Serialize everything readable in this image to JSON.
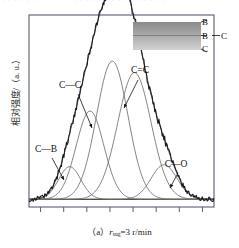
{
  "figure": {
    "id": "(a)",
    "caption_prefix": "（a）",
    "caption_var": "r",
    "caption_sub": "sug",
    "caption_rest": "=3 r/min",
    "caption_full": "（a） r sug =3 r/min",
    "y_axis_label": "相对强度/（a. u.）",
    "top_clipped_text_left": "· · · · · ·",
    "top_clipped_text_right": "· · · · · · · · · · · · · · ·"
  },
  "peak_labels": [
    {
      "key": "c-b",
      "text": "C—B",
      "x": 46,
      "y": 152
    },
    {
      "key": "c-c",
      "text": "C—C",
      "x": 70,
      "y": 88
    },
    {
      "key": "c=c",
      "text": "C=C",
      "x": 140,
      "y": 73
    },
    {
      "key": "c-o",
      "text": "C—O",
      "x": 176,
      "y": 167
    }
  ],
  "inset": {
    "name": "layer-gradient-inset",
    "top_color": "#8a8a8a",
    "bottom_color": "#d2d2d2",
    "labels": [
      {
        "key": "b",
        "text": "B",
        "x": 205,
        "y": 25
      },
      {
        "key": "b-c",
        "text": "B",
        "x": 205,
        "y": 39
      },
      {
        "key": "b-c2",
        "text": "C",
        "x": 224,
        "y": 39
      },
      {
        "key": "c",
        "text": "C",
        "x": 205,
        "y": 52
      }
    ]
  },
  "chart_data": {
    "type": "line",
    "title": "",
    "xlabel": "",
    "ylabel": "相对强度/（a. u.）",
    "grid": false,
    "legend": "none",
    "xlim": [
      0,
      100
    ],
    "ylim": [
      0,
      100
    ],
    "x_tick_count": 8,
    "x_tick_labels": [],
    "y_tick_labels": [],
    "baseline_level": 4,
    "series": [
      {
        "name": "measured-spectrum",
        "kind": "noisy-envelope",
        "color": "#1a1a1a",
        "note": "sum of components plus noise"
      },
      {
        "name": "fit-envelope",
        "kind": "smooth-sum",
        "color": "#444444"
      }
    ],
    "components": [
      {
        "name": "C—B",
        "center": 22,
        "amplitude": 17,
        "width": 6.0,
        "color": "#6e6e6e"
      },
      {
        "name": "C—C",
        "center": 33,
        "amplitude": 46,
        "width": 7.5,
        "color": "#6e6e6e"
      },
      {
        "name": "C—C 2",
        "center": 45,
        "amplitude": 72,
        "width": 8.5,
        "color": "#6e6e6e"
      },
      {
        "name": "C=C",
        "center": 57,
        "amplitude": 66,
        "width": 9.0,
        "color": "#6e6e6e"
      },
      {
        "name": "C—O",
        "center": 73,
        "amplitude": 18,
        "width": 7.0,
        "color": "#6e6e6e"
      }
    ]
  },
  "colors": {
    "frame": "#5a5a78",
    "curve": "#1a1a1a",
    "component": "#6e6e6e",
    "baseline": "#222222",
    "text": "#111111"
  }
}
